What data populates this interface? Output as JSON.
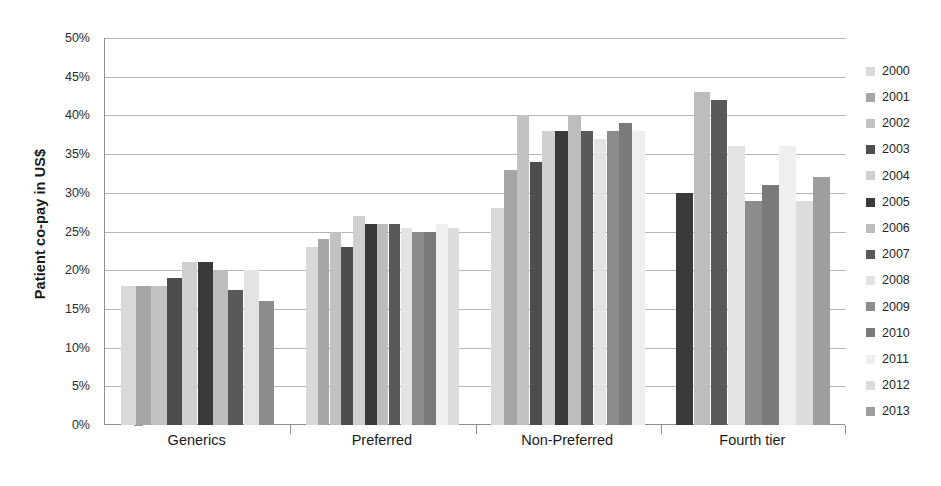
{
  "chart_data": {
    "type": "bar",
    "title": "",
    "xlabel": "",
    "ylabel": "Patient co-pay in US$",
    "ylim": [
      0,
      50
    ],
    "ytick_labels": [
      "0%",
      "5%",
      "10%",
      "15%",
      "20%",
      "25%",
      "30%",
      "35%",
      "40%",
      "45%",
      "50%"
    ],
    "ytick_values": [
      0,
      5,
      10,
      15,
      20,
      25,
      30,
      35,
      40,
      45,
      50
    ],
    "grid": true,
    "legend_position": "right",
    "categories": [
      "Generics",
      "Preferred",
      "Non-Preferred",
      "Fourth tier"
    ],
    "series": [
      {
        "name": "2000",
        "color": "#d9d9d9",
        "values": [
          18,
          23,
          28,
          null
        ]
      },
      {
        "name": "2001",
        "color": "#a6a6a6",
        "values": [
          18,
          24,
          33,
          null
        ]
      },
      {
        "name": "2002",
        "color": "#c2c2c2",
        "values": [
          18,
          25,
          40,
          null
        ]
      },
      {
        "name": "2003",
        "color": "#4d4d4d",
        "values": [
          19,
          23,
          34,
          null
        ]
      },
      {
        "name": "2004",
        "color": "#d0d0d0",
        "values": [
          21,
          27,
          38,
          null
        ]
      },
      {
        "name": "2005",
        "color": "#3a3a3a",
        "values": [
          21,
          26,
          38,
          30
        ]
      },
      {
        "name": "2006",
        "color": "#bdbdbd",
        "values": [
          20,
          26,
          40,
          43
        ]
      },
      {
        "name": "2007",
        "color": "#595959",
        "values": [
          17.5,
          26,
          38,
          42
        ]
      },
      {
        "name": "2008",
        "color": "#e3e3e3",
        "values": [
          20,
          25.5,
          37,
          36
        ]
      },
      {
        "name": "2009",
        "color": "#8c8c8c",
        "values": [
          16,
          25,
          38,
          29
        ]
      },
      {
        "name": "2010",
        "color": "#7a7a7a",
        "values": [
          null,
          25,
          39,
          31
        ]
      },
      {
        "name": "2011",
        "color": "#efefef",
        "values": [
          null,
          26,
          38,
          36
        ]
      },
      {
        "name": "2012",
        "color": "#dcdcdc",
        "values": [
          null,
          25.5,
          null,
          29
        ]
      },
      {
        "name": "2013",
        "color": "#9e9e9e",
        "values": [
          null,
          null,
          null,
          32
        ]
      }
    ]
  },
  "axis": {
    "y_title": "Patient co-pay in US$"
  },
  "legend": {
    "items": [
      {
        "label": "2000"
      },
      {
        "label": "2001"
      },
      {
        "label": "2002"
      },
      {
        "label": "2003"
      },
      {
        "label": "2004"
      },
      {
        "label": "2005"
      },
      {
        "label": "2006"
      },
      {
        "label": "2007"
      },
      {
        "label": "2008"
      },
      {
        "label": "2009"
      },
      {
        "label": "2010"
      },
      {
        "label": "2011"
      },
      {
        "label": "2012"
      },
      {
        "label": "2013"
      }
    ]
  }
}
